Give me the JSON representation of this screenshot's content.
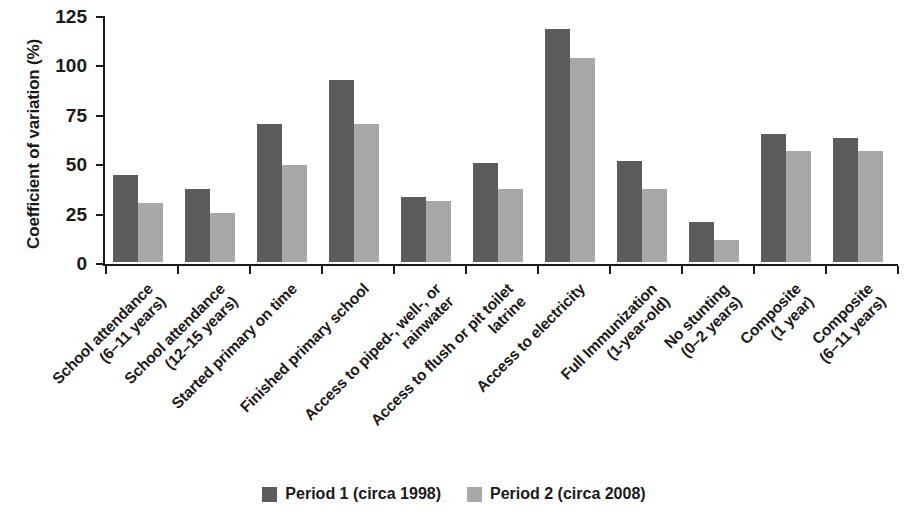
{
  "chart_data": {
    "type": "bar",
    "title": "",
    "xlabel": "",
    "ylabel": "Coefficient of variation (%)",
    "ylim": [
      0,
      125
    ],
    "yticks": [
      0,
      25,
      50,
      75,
      100,
      125
    ],
    "ytick_labels": [
      "0",
      "25",
      "50",
      "75",
      "100",
      "125"
    ],
    "grid": false,
    "legend_position": "bottom-center",
    "categories": [
      "School attendance (6–11 years)",
      "School attendance (12–15 years)",
      "Started primary on time",
      "Finished primary school",
      "Access to piped-, well-, or rainwater",
      "Access to flush or pit toilet latrine",
      "Access to electricity",
      "Full Immunization (1-year-old)",
      "No stunting (0–2 years)",
      "Composite (1 year)",
      "Composite (6–11 years)"
    ],
    "category_lines": [
      [
        "School attendance",
        "(6–11 years)"
      ],
      [
        "School attendance",
        "(12–15 years)"
      ],
      [
        "Started primary on time",
        ""
      ],
      [
        "Finished primary school",
        ""
      ],
      [
        "Access to piped-, well-, or",
        "rainwater"
      ],
      [
        "Access to flush or pit toilet",
        "latrine"
      ],
      [
        "Access to electricity",
        ""
      ],
      [
        "Full Immunization",
        "(1-year-old)"
      ],
      [
        "No stunting",
        "(0–2 years)"
      ],
      [
        "Composite",
        "(1 year)"
      ],
      [
        "Composite",
        "(6–11 years)"
      ]
    ],
    "series": [
      {
        "name": "Period 1 (circa 1998)",
        "color": "#5c5c5c",
        "values": [
          44,
          37,
          70,
          92,
          33,
          50,
          118,
          51,
          20,
          65,
          63
        ]
      },
      {
        "name": "Period 2 (circa 2008)",
        "color": "#a8a8a8",
        "values": [
          30,
          25,
          49,
          70,
          31,
          37,
          103,
          37,
          11,
          56,
          56
        ]
      }
    ]
  },
  "legend": {
    "entries": [
      {
        "label": "Period 1 (circa 1998)"
      },
      {
        "label": "Period 2 (circa 2008)"
      }
    ]
  }
}
